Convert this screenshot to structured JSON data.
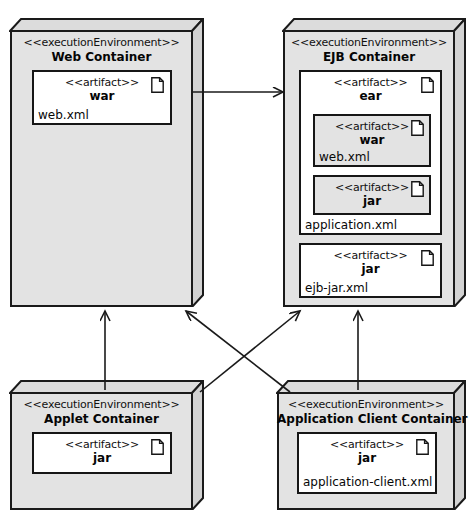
{
  "diagram": {
    "type": "uml-deployment-diagram",
    "stereotype_node": "<<executionEnvironment>>",
    "stereotype_artifact": "<<artifact>>",
    "colors": {
      "node_fill": "#e3e3e3",
      "artifact_fill": "#ffffff",
      "stroke": "#161616",
      "background": "#ffffff"
    }
  },
  "nodes": {
    "web_container": {
      "stereotype": "<<executionEnvironment>>",
      "name": "Web Container",
      "artifacts": {
        "war": {
          "stereotype": "<<artifact>>",
          "name": "war",
          "descriptor": "web.xml",
          "icon": "document-icon"
        }
      }
    },
    "ejb_container": {
      "stereotype": "<<executionEnvironment>>",
      "name": "EJB Container",
      "artifacts": {
        "ear": {
          "stereotype": "<<artifact>>",
          "name": "ear",
          "descriptor": "application.xml",
          "icon": "document-icon",
          "nested": {
            "war": {
              "stereotype": "<<artifact>>",
              "name": "war",
              "descriptor": "web.xml",
              "icon": "document-icon"
            },
            "jar": {
              "stereotype": "<<artifact>>",
              "name": "jar",
              "descriptor": "",
              "icon": "document-icon"
            }
          }
        },
        "ejb_jar": {
          "stereotype": "<<artifact>>",
          "name": "jar",
          "descriptor": "ejb-jar.xml",
          "icon": "document-icon"
        }
      }
    },
    "applet_container": {
      "stereotype": "<<executionEnvironment>>",
      "name": "Applet Container",
      "artifacts": {
        "jar": {
          "stereotype": "<<artifact>>",
          "name": "jar",
          "descriptor": "",
          "icon": "document-icon"
        }
      }
    },
    "application_client_container": {
      "stereotype": "<<executionEnvironment>>",
      "name": "Application Client Container",
      "artifacts": {
        "jar": {
          "stereotype": "<<artifact>>",
          "name": "jar",
          "descriptor": "application-client.xml",
          "icon": "document-icon"
        }
      }
    }
  },
  "edges": [
    {
      "id": "web-to-ejb",
      "from": "web_container",
      "to": "ejb_container",
      "arrow": "open",
      "label": ""
    },
    {
      "id": "applet-to-web",
      "from": "applet_container",
      "to": "web_container",
      "arrow": "open",
      "label": ""
    },
    {
      "id": "applet-to-ejb",
      "from": "applet_container",
      "to": "ejb_container",
      "arrow": "open",
      "label": ""
    },
    {
      "id": "appclient-to-web",
      "from": "application_client_container",
      "to": "web_container",
      "arrow": "open",
      "label": ""
    },
    {
      "id": "appclient-to-ejb",
      "from": "application_client_container",
      "to": "ejb_container",
      "arrow": "open",
      "label": ""
    }
  ]
}
